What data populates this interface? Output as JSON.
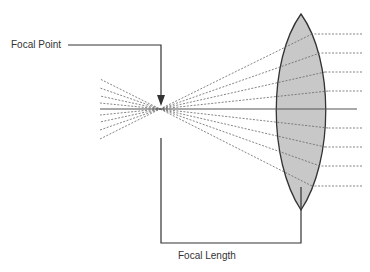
{
  "diagram": {
    "labels": {
      "focal_point": "Focal Point",
      "focal_length": "Focal Length"
    },
    "colors": {
      "lens_fill": "#c8c8c8",
      "lens_stroke": "#333333",
      "line": "#333333",
      "ray": "#666666",
      "axis": "#555555"
    },
    "geometry": {
      "focal_point": [
        160,
        109
      ],
      "lens_top": [
        301,
        14
      ],
      "lens_bottom": [
        301,
        210
      ],
      "axis_y": 109,
      "ray_y": [
        34,
        53,
        72,
        91,
        128,
        147,
        166,
        186
      ]
    }
  }
}
